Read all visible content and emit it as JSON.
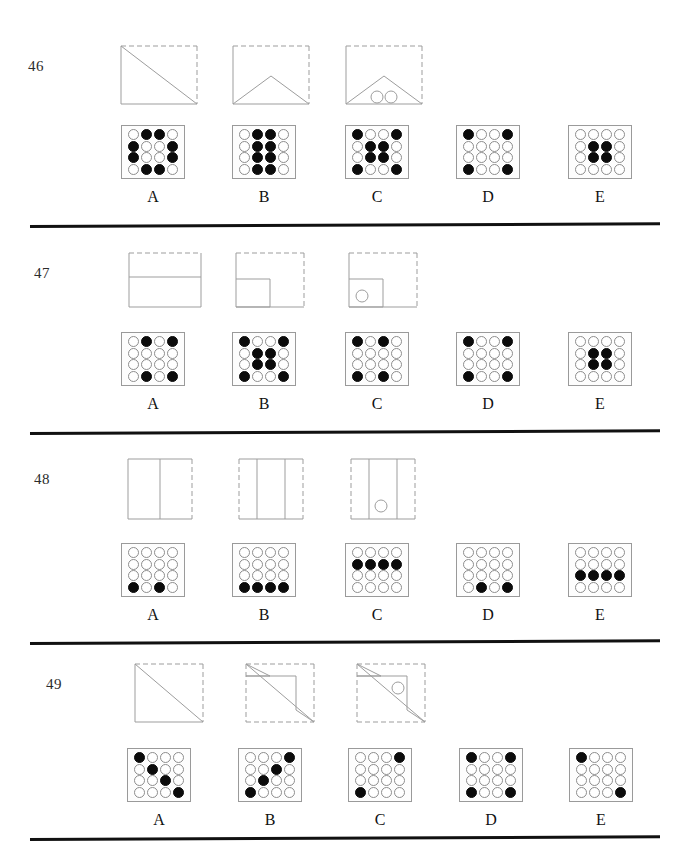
{
  "page": {
    "width": 675,
    "height": 846,
    "background": "#ffffff",
    "ink": "#111111",
    "dot_filled_color": "#0b0b0b",
    "dot_empty_color": "#ffffff",
    "dot_outline_color": "#8d8d8d",
    "panel_outline_color": "#9a9a9a",
    "figure_line_color": "#9d9d9d"
  },
  "option_labels": [
    "A",
    "B",
    "C",
    "D",
    "E"
  ],
  "questions": [
    {
      "number": "46",
      "top": 45,
      "num_left": 28,
      "num_top": 13,
      "options_top": 80,
      "rule_top": 225,
      "stimulus": [
        {
          "name": "square-with-main-diagonal",
          "left": 120,
          "width": 78,
          "height": 60,
          "viewbox": "0 0 78 60",
          "solid_edges": [
            "left",
            "bottom"
          ],
          "dashed_edges": [
            "top",
            "right"
          ],
          "paths": [
            {
              "d": "M1,1 L77,59",
              "style": "solid"
            }
          ],
          "circles": []
        },
        {
          "name": "square-with-chevron-fold",
          "left": 232,
          "width": 78,
          "height": 60,
          "viewbox": "0 0 78 60",
          "solid_edges": [
            "left-partial",
            "bottom"
          ],
          "dashed_edges": [
            "top",
            "right"
          ],
          "paths": [
            {
              "d": "M1,59 L39,31 L77,59",
              "style": "solid"
            }
          ],
          "circles": []
        },
        {
          "name": "square-with-chevron-and-two-holes",
          "left": 345,
          "width": 78,
          "height": 60,
          "viewbox": "0 0 78 60",
          "solid_edges": [
            "left-partial",
            "bottom"
          ],
          "dashed_edges": [
            "top",
            "right"
          ],
          "paths": [
            {
              "d": "M1,59 L39,31 L77,59",
              "style": "solid"
            }
          ],
          "circles": [
            {
              "cx": 32,
              "cy": 52,
              "r": 6
            },
            {
              "cx": 46,
              "cy": 52,
              "r": 6
            }
          ]
        }
      ],
      "options": [
        {
          "label": "A",
          "left": 118,
          "grid": [
            [
              0,
              1,
              1,
              0
            ],
            [
              1,
              0,
              0,
              1
            ],
            [
              1,
              0,
              0,
              1
            ],
            [
              0,
              1,
              1,
              0
            ]
          ]
        },
        {
          "label": "B",
          "left": 229,
          "grid": [
            [
              0,
              1,
              1,
              0
            ],
            [
              0,
              1,
              1,
              0
            ],
            [
              0,
              1,
              1,
              0
            ],
            [
              0,
              1,
              1,
              0
            ]
          ]
        },
        {
          "label": "C",
          "left": 342,
          "grid": [
            [
              1,
              0,
              0,
              1
            ],
            [
              0,
              1,
              1,
              0
            ],
            [
              0,
              1,
              1,
              0
            ],
            [
              1,
              0,
              0,
              1
            ]
          ]
        },
        {
          "label": "D",
          "left": 453,
          "grid": [
            [
              1,
              0,
              0,
              1
            ],
            [
              0,
              0,
              0,
              0
            ],
            [
              0,
              0,
              0,
              0
            ],
            [
              1,
              0,
              0,
              1
            ]
          ]
        },
        {
          "label": "E",
          "left": 565,
          "grid": [
            [
              0,
              0,
              0,
              0
            ],
            [
              0,
              1,
              1,
              0
            ],
            [
              0,
              1,
              1,
              0
            ],
            [
              0,
              0,
              0,
              0
            ]
          ]
        }
      ]
    },
    {
      "number": "47",
      "top": 252,
      "num_left": 34,
      "num_top": 13,
      "options_top": 80,
      "rule_top": 432,
      "stimulus": [
        {
          "name": "rectangle-with-horizontal-fold",
          "left": 128,
          "width": 74,
          "height": 56,
          "viewbox": "0 0 74 56",
          "solid_edges": [
            "left-lower",
            "bottom",
            "right-lower"
          ],
          "dashed_edges": [
            "top",
            "left-upper",
            "right-upper"
          ],
          "paths": [
            {
              "d": "M1,25 L73,25",
              "style": "solid"
            }
          ],
          "circles": []
        },
        {
          "name": "square-with-small-square-bottom-left",
          "left": 235,
          "width": 70,
          "height": 56,
          "viewbox": "0 0 70 56",
          "solid_edges": [
            "left-lower",
            "bottom-left"
          ],
          "dashed_edges": [
            "top",
            "right",
            "bottom-right",
            "left-upper"
          ],
          "paths": [
            {
              "d": "M1,27 L35,27 L35,55 L1,55",
              "style": "solid"
            }
          ],
          "circles": []
        },
        {
          "name": "square-with-small-square-and-hole",
          "left": 348,
          "width": 70,
          "height": 56,
          "viewbox": "0 0 70 56",
          "solid_edges": [
            "left-lower",
            "bottom-left"
          ],
          "dashed_edges": [
            "top",
            "right",
            "bottom-right",
            "left-upper"
          ],
          "paths": [
            {
              "d": "M1,27 L35,27 L35,55 L1,55",
              "style": "solid"
            }
          ],
          "circles": [
            {
              "cx": 14,
              "cy": 44,
              "r": 6
            }
          ]
        }
      ],
      "options": [
        {
          "label": "A",
          "left": 118,
          "grid": [
            [
              0,
              1,
              0,
              1
            ],
            [
              0,
              0,
              0,
              0
            ],
            [
              0,
              0,
              0,
              0
            ],
            [
              0,
              1,
              0,
              1
            ]
          ]
        },
        {
          "label": "B",
          "left": 229,
          "grid": [
            [
              1,
              0,
              0,
              1
            ],
            [
              0,
              1,
              1,
              0
            ],
            [
              0,
              1,
              1,
              0
            ],
            [
              1,
              0,
              0,
              1
            ]
          ]
        },
        {
          "label": "C",
          "left": 342,
          "grid": [
            [
              1,
              0,
              1,
              0
            ],
            [
              0,
              0,
              0,
              0
            ],
            [
              0,
              0,
              0,
              0
            ],
            [
              1,
              0,
              1,
              0
            ]
          ]
        },
        {
          "label": "D",
          "left": 453,
          "grid": [
            [
              1,
              0,
              0,
              1
            ],
            [
              0,
              0,
              0,
              0
            ],
            [
              0,
              0,
              0,
              0
            ],
            [
              1,
              0,
              0,
              1
            ]
          ]
        },
        {
          "label": "E",
          "left": 565,
          "grid": [
            [
              0,
              0,
              0,
              0
            ],
            [
              0,
              1,
              1,
              0
            ],
            [
              0,
              1,
              1,
              0
            ],
            [
              0,
              0,
              0,
              0
            ]
          ]
        }
      ]
    },
    {
      "number": "48",
      "top": 458,
      "num_left": 34,
      "num_top": 13,
      "options_top": 85,
      "rule_top": 642,
      "stimulus": [
        {
          "name": "square-with-vertical-fold",
          "left": 127,
          "width": 66,
          "height": 62,
          "viewbox": "0 0 66 62",
          "solid_edges": [
            "left",
            "top-left",
            "bottom-left"
          ],
          "dashed_edges": [
            "right",
            "top-right",
            "bottom-right"
          ],
          "paths": [
            {
              "d": "M33,1 L33,61",
              "style": "solid"
            }
          ],
          "circles": []
        },
        {
          "name": "square-with-two-vertical-folds",
          "left": 238,
          "width": 66,
          "height": 62,
          "viewbox": "0 0 66 62",
          "solid_edges": [
            "top-middle",
            "bottom-middle"
          ],
          "dashed_edges": [
            "left",
            "right",
            "top-outer",
            "bottom-outer"
          ],
          "paths": [
            {
              "d": "M19,1 L19,61",
              "style": "solid"
            },
            {
              "d": "M47,1 L47,61",
              "style": "solid"
            }
          ],
          "circles": []
        },
        {
          "name": "square-with-two-folds-and-hole",
          "left": 350,
          "width": 66,
          "height": 62,
          "viewbox": "0 0 66 62",
          "solid_edges": [
            "top-middle",
            "bottom-middle"
          ],
          "dashed_edges": [
            "left",
            "right",
            "top-outer",
            "bottom-outer"
          ],
          "paths": [
            {
              "d": "M19,1 L19,61",
              "style": "solid"
            },
            {
              "d": "M47,1 L47,61",
              "style": "solid"
            }
          ],
          "circles": [
            {
              "cx": 31,
              "cy": 48,
              "r": 6
            }
          ]
        }
      ],
      "options": [
        {
          "label": "A",
          "left": 118,
          "grid": [
            [
              0,
              0,
              0,
              0
            ],
            [
              0,
              0,
              0,
              0
            ],
            [
              0,
              0,
              0,
              0
            ],
            [
              1,
              0,
              1,
              0
            ]
          ]
        },
        {
          "label": "B",
          "left": 229,
          "grid": [
            [
              0,
              0,
              0,
              0
            ],
            [
              0,
              0,
              0,
              0
            ],
            [
              0,
              0,
              0,
              0
            ],
            [
              1,
              1,
              1,
              1
            ]
          ]
        },
        {
          "label": "C",
          "left": 342,
          "grid": [
            [
              0,
              0,
              0,
              0
            ],
            [
              1,
              1,
              1,
              1
            ],
            [
              0,
              0,
              0,
              0
            ],
            [
              0,
              0,
              0,
              0
            ]
          ]
        },
        {
          "label": "D",
          "left": 453,
          "grid": [
            [
              0,
              0,
              0,
              0
            ],
            [
              0,
              0,
              0,
              0
            ],
            [
              0,
              0,
              0,
              0
            ],
            [
              0,
              1,
              0,
              1
            ]
          ]
        },
        {
          "label": "E",
          "left": 565,
          "grid": [
            [
              0,
              0,
              0,
              0
            ],
            [
              0,
              0,
              0,
              0
            ],
            [
              1,
              1,
              1,
              1
            ],
            [
              0,
              0,
              0,
              0
            ]
          ]
        }
      ]
    },
    {
      "number": "49",
      "top": 663,
      "num_left": 46,
      "num_top": 13,
      "options_top": 85,
      "rule_top": 838,
      "stimulus": [
        {
          "name": "square-with-main-diagonal",
          "left": 134,
          "width": 70,
          "height": 60,
          "viewbox": "0 0 70 60",
          "solid_edges": [
            "left",
            "bottom"
          ],
          "dashed_edges": [
            "top",
            "right"
          ],
          "paths": [
            {
              "d": "M1,1 L69,59",
              "style": "solid"
            }
          ],
          "circles": []
        },
        {
          "name": "square-with-diagonal-and-folded-corner",
          "left": 245,
          "width": 70,
          "height": 60,
          "viewbox": "0 0 70 60",
          "solid_edges": [],
          "dashed_edges": [
            "top",
            "right",
            "bottom",
            "left"
          ],
          "paths": [
            {
              "d": "M1,1 L69,59",
              "style": "solid"
            },
            {
              "d": "M1,1 L25,13 L1,13",
              "style": "solid"
            },
            {
              "d": "M1,13 L51,13 L51,47 L69,59",
              "style": "solid"
            }
          ],
          "circles": []
        },
        {
          "name": "square-with-diagonal-folded-corner-and-hole",
          "left": 356,
          "width": 70,
          "height": 60,
          "viewbox": "0 0 70 60",
          "solid_edges": [],
          "dashed_edges": [
            "top",
            "right",
            "bottom",
            "left"
          ],
          "paths": [
            {
              "d": "M1,1 L69,59",
              "style": "solid"
            },
            {
              "d": "M1,1 L25,13 L1,13",
              "style": "solid"
            },
            {
              "d": "M1,13 L51,13 L51,47 L69,59",
              "style": "solid"
            }
          ],
          "circles": [
            {
              "cx": 42,
              "cy": 25,
              "r": 6
            }
          ]
        }
      ],
      "options": [
        {
          "label": "A",
          "left": 124,
          "grid": [
            [
              1,
              0,
              0,
              0
            ],
            [
              0,
              1,
              0,
              0
            ],
            [
              0,
              0,
              1,
              0
            ],
            [
              0,
              0,
              0,
              1
            ]
          ]
        },
        {
          "label": "B",
          "left": 235,
          "grid": [
            [
              0,
              0,
              0,
              1
            ],
            [
              0,
              0,
              1,
              0
            ],
            [
              0,
              1,
              0,
              0
            ],
            [
              1,
              0,
              0,
              0
            ]
          ]
        },
        {
          "label": "C",
          "left": 345,
          "grid": [
            [
              0,
              0,
              0,
              1
            ],
            [
              0,
              0,
              0,
              0
            ],
            [
              0,
              0,
              0,
              0
            ],
            [
              1,
              0,
              0,
              0
            ]
          ]
        },
        {
          "label": "D",
          "left": 456,
          "grid": [
            [
              1,
              0,
              0,
              1
            ],
            [
              0,
              0,
              0,
              0
            ],
            [
              0,
              0,
              0,
              0
            ],
            [
              1,
              0,
              0,
              1
            ]
          ]
        },
        {
          "label": "E",
          "left": 566,
          "grid": [
            [
              1,
              0,
              0,
              0
            ],
            [
              0,
              0,
              0,
              0
            ],
            [
              0,
              0,
              0,
              0
            ],
            [
              0,
              0,
              0,
              1
            ]
          ]
        }
      ]
    }
  ]
}
